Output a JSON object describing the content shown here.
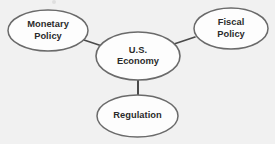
{
  "diagram": {
    "type": "concept-map",
    "background_color": "#f1f1f1",
    "node_fill_color": "#fdfdfd",
    "node_border_color": "#6a6a6a",
    "connector_color": "#4a4a4a",
    "text_color": "#2b2b2b",
    "center": {
      "id": "us-economy",
      "label": "U.S.\nEconomy",
      "line1": "U.S.",
      "line2": "Economy",
      "cx": 138,
      "cy": 56,
      "rx": 42,
      "ry": 24
    },
    "nodes": [
      {
        "id": "monetary-policy",
        "label": "Monetary\nPolicy",
        "line1": "Monetary",
        "line2": "Policy",
        "cx": 48,
        "cy": 30.5,
        "rx": 40,
        "ry": 20.5
      },
      {
        "id": "fiscal-policy",
        "label": "Fiscal\nPolicy",
        "line1": "Fiscal",
        "line2": "Policy",
        "cx": 231,
        "cy": 28.5,
        "rx": 37,
        "ry": 20.5
      },
      {
        "id": "regulation",
        "label": "Regulation",
        "line1": "Regulation",
        "line2": "",
        "cx": 137.5,
        "cy": 116,
        "rx": 40.5,
        "ry": 21
      }
    ],
    "connectors": [
      {
        "id": "connector-monetary-to-center",
        "from": "monetary-policy",
        "to": "us-economy",
        "x1": 84,
        "y1": 40,
        "x2": 102,
        "y2": 46
      },
      {
        "id": "connector-center-to-fiscal",
        "from": "us-economy",
        "to": "fiscal-policy",
        "x1": 174,
        "y1": 44,
        "x2": 195,
        "y2": 37
      },
      {
        "id": "connector-center-to-regulation",
        "from": "us-economy",
        "to": "regulation",
        "x1": 138,
        "y1": 79,
        "x2": 138,
        "y2": 96
      }
    ]
  }
}
